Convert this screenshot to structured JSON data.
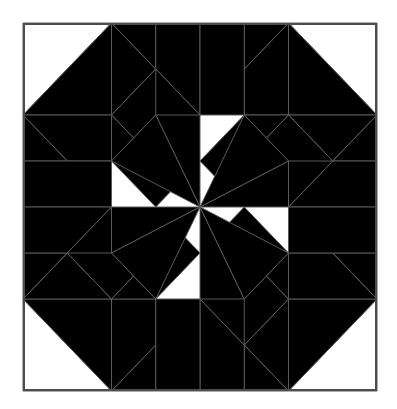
{
  "figure": {
    "background_color": "#ffffff",
    "canvas": {
      "width": 397,
      "height": 409
    }
  },
  "frame": {
    "name": "outer-border",
    "stroke_color": "#4d4d4d",
    "stroke_width": 2,
    "fill": "#ffffff",
    "x": 23,
    "y": 23,
    "width": 354,
    "height": 368
  },
  "palette": {
    "white": "#ffffff",
    "light_gray": "#c9c9c9",
    "medium_gray": "#808080",
    "dark_gray": "#2b2b2b",
    "outline": "#4d4d4d",
    "piece_outline": "#5a5a5a"
  },
  "geometry": {
    "center_x": 200,
    "center_y": 207,
    "grid_step_x": 44.25,
    "grid_step_y": 46.0,
    "columns": 8,
    "rows": 8,
    "symmetry": "4-fold rotational (90 degrees) about center",
    "star_points": 8,
    "description": "Eight-pointed LeMoyne star at center, surrounded by a ring of square and diamond patches forming a second radiating star; corners filled with half-square triangles."
  },
  "legend": {
    "items": [
      {
        "label": "Dark patch",
        "color": "#2b2b2b",
        "name": "dark-swatch"
      },
      {
        "label": "Medium patch",
        "color": "#808080",
        "name": "medium-swatch"
      },
      {
        "label": "Light patch",
        "color": "#c9c9c9",
        "name": "light-swatch"
      },
      {
        "label": "Background",
        "color": "#ffffff",
        "name": "background-swatch"
      }
    ]
  },
  "chart_data": {
    "type": "table",
    "xlabel": "",
    "ylabel": "",
    "categories": [
      "dark",
      "medium",
      "light",
      "white"
    ],
    "values": [
      24,
      32,
      24,
      8
    ]
  }
}
